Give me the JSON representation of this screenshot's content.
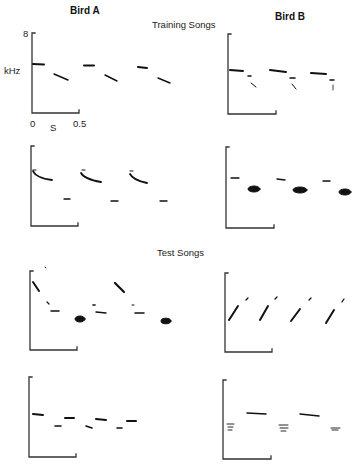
{
  "headers": {
    "bird_a": "Bird A",
    "bird_b": "Bird B"
  },
  "sections": {
    "training": "Training Songs",
    "test": "Test Songs"
  },
  "axes": {
    "y_label": "kHz",
    "y_max_tick": "8",
    "x_label": "S",
    "x_start_tick": "0",
    "x_end_tick": "0.5"
  },
  "panels": [
    {
      "id": "bird-a-training-1",
      "bird": "Bird A",
      "group": "Training Songs"
    },
    {
      "id": "bird-b-training-1",
      "bird": "Bird B",
      "group": "Training Songs"
    },
    {
      "id": "bird-a-training-2",
      "bird": "Bird A",
      "group": "Training Songs"
    },
    {
      "id": "bird-b-training-2",
      "bird": "Bird B",
      "group": "Training Songs"
    },
    {
      "id": "bird-a-test-1",
      "bird": "Bird A",
      "group": "Test Songs"
    },
    {
      "id": "bird-b-test-1",
      "bird": "Bird B",
      "group": "Test Songs"
    },
    {
      "id": "bird-a-test-2",
      "bird": "Bird A",
      "group": "Test Songs"
    },
    {
      "id": "bird-b-test-2",
      "bird": "Bird B",
      "group": "Test Songs"
    }
  ],
  "colors": {
    "ink": "#111111",
    "axis": "#333333",
    "background": "#ffffff"
  }
}
